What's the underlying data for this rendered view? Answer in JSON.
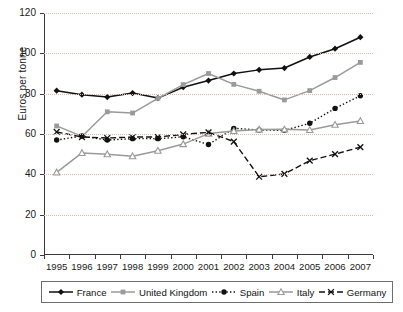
{
  "chart_data": {
    "type": "line",
    "title": "",
    "subtitle": "",
    "xlabel": "",
    "ylabel": "Euros per tonne",
    "categories": [
      "1995",
      "1996",
      "1997",
      "1998",
      "1999",
      "2000",
      "2001",
      "2002",
      "2003",
      "2004",
      "2005",
      "2006",
      "2007"
    ],
    "x": [
      1995,
      1996,
      1997,
      1998,
      1999,
      2000,
      2001,
      2002,
      2003,
      2004,
      2005,
      2006,
      2007
    ],
    "xlim": [
      1995,
      2007
    ],
    "ylim": [
      0,
      120
    ],
    "yticks": [
      0,
      20,
      40,
      60,
      80,
      100,
      120
    ],
    "ytick_labels": [
      "0",
      "20",
      "40",
      "60",
      "80",
      "100",
      "120"
    ],
    "grid": true,
    "grid_axis": "y",
    "grid_style": "dotted",
    "grid_color": "#d9b9b9",
    "legend_position": "bottom",
    "series": [
      {
        "name": "France",
        "color": "#111111",
        "line_style": "solid",
        "marker": "diamond",
        "marker_color": "#111111",
        "values": [
          81.5,
          79.5,
          78.3,
          80.3,
          77.8,
          83.2,
          86.5,
          90.0,
          91.8,
          92.7,
          98.2,
          102.3,
          108.0
        ]
      },
      {
        "name": "United Kingdom",
        "color": "#9a9a9a",
        "line_style": "solid",
        "marker": "square",
        "marker_color": "#9a9a9a",
        "values": [
          64.0,
          58.8,
          71.0,
          70.4,
          77.7,
          84.5,
          90.0,
          84.6,
          81.2,
          76.9,
          81.5,
          88.0,
          95.5
        ]
      },
      {
        "name": "Spain",
        "color": "#111111",
        "line_style": "dotted",
        "marker": "circle",
        "marker_color": "#111111",
        "values": [
          57.0,
          59.0,
          57.0,
          57.7,
          57.7,
          58.6,
          54.8,
          62.8,
          62.0,
          61.8,
          65.3,
          72.7,
          79.0
        ]
      },
      {
        "name": "Italy",
        "color": "#9a9a9a",
        "line_style": "solid",
        "marker": "triangle",
        "marker_color": "#9a9a9a",
        "values": [
          41.0,
          50.6,
          50.0,
          49.0,
          51.7,
          55.0,
          60.2,
          61.5,
          62.2,
          62.3,
          62.0,
          64.6,
          66.5
        ]
      },
      {
        "name": "Germany",
        "color": "#111111",
        "line_style": "dashed",
        "marker": "cross",
        "marker_color": "#111111",
        "values": [
          61.0,
          58.5,
          58.0,
          58.5,
          58.5,
          59.8,
          60.8,
          56.2,
          38.8,
          40.2,
          46.8,
          50.0,
          53.5
        ]
      }
    ]
  },
  "legend": {
    "items": [
      {
        "label": "France"
      },
      {
        "label": "United Kingdom"
      },
      {
        "label": "Spain"
      },
      {
        "label": "Italy"
      },
      {
        "label": "Germany"
      }
    ]
  }
}
